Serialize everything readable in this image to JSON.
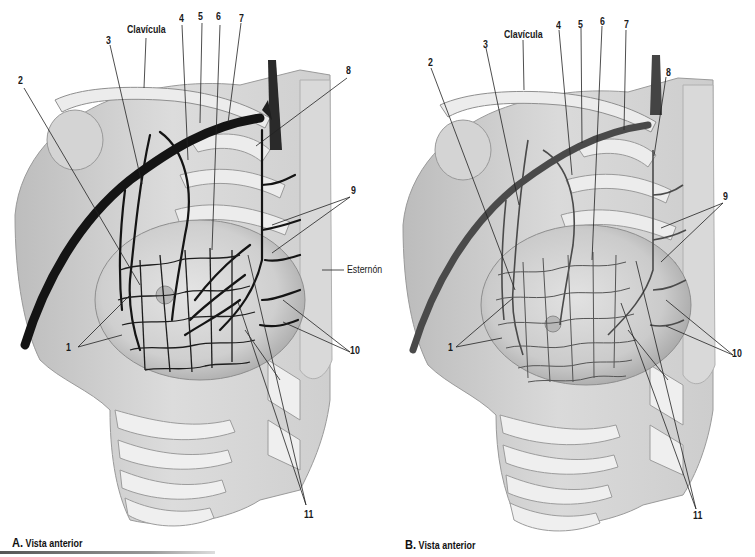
{
  "figure": {
    "panels": [
      {
        "id": "A",
        "caption_letter": "A.",
        "caption_text": "Vista anterior",
        "labels": {
          "clavicula": "Clavícula",
          "esternon": "Esternón",
          "n1": "1",
          "n2": "2",
          "n3": "3",
          "n4": "4",
          "n5": "5",
          "n6": "6",
          "n7": "7",
          "n8": "8",
          "n9": "9",
          "n10": "10",
          "n11": "11"
        },
        "vessel_color": "#141414"
      },
      {
        "id": "B",
        "caption_letter": "B.",
        "caption_text": "Vista anterior",
        "labels": {
          "clavicula": "Clavícula",
          "n1": "1",
          "n2": "2",
          "n3": "3",
          "n4": "4",
          "n5": "5",
          "n6": "6",
          "n7": "7",
          "n8": "8",
          "n9": "9",
          "n10": "10",
          "n11": "11"
        },
        "vessel_color": "#4a4a4a"
      }
    ],
    "colors": {
      "background": "#ffffff",
      "tissue_light": "#e6e6e6",
      "tissue_mid": "#c8c8c8",
      "bone": "#efefef",
      "leader_line": "#222222"
    }
  }
}
